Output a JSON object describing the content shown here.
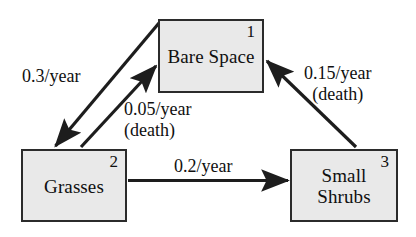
{
  "diagram": {
    "background_color": "#ffffff",
    "node_fill_color": "#e9e9e9",
    "node_border_color": "#2b2b2b",
    "text_color": "#101010",
    "nodes": [
      {
        "id": "bare-space",
        "label": "Bare Space",
        "index": "1"
      },
      {
        "id": "grasses",
        "label": "Grasses",
        "index": "2"
      },
      {
        "id": "small-shrubs",
        "label_line_1": "Small",
        "label_line_2": "Shrubs",
        "index": "3"
      }
    ],
    "edges": [
      {
        "id": "bare-to-grasses",
        "from": "bare-space",
        "to": "grasses",
        "rate": "0.3/year",
        "note": ""
      },
      {
        "id": "grasses-to-bare",
        "from": "grasses",
        "to": "bare-space",
        "rate": "0.05/year",
        "note": "(death)"
      },
      {
        "id": "shrubs-to-bare",
        "from": "small-shrubs",
        "to": "bare-space",
        "rate": "0.15/year",
        "note": "(death)"
      },
      {
        "id": "grasses-to-shrubs",
        "from": "grasses",
        "to": "small-shrubs",
        "rate": "0.2/year",
        "note": ""
      }
    ]
  }
}
